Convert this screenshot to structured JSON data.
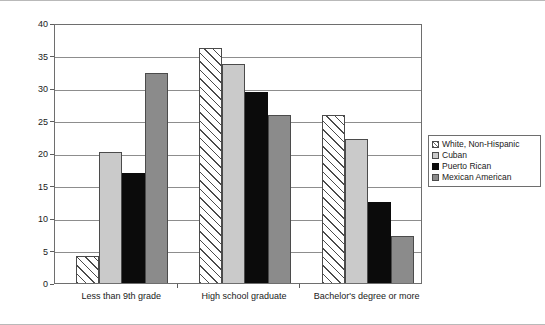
{
  "chart_data": {
    "type": "bar",
    "title": "",
    "subtitle": "",
    "xlabel": "",
    "ylabel": "Percent",
    "ylim": [
      0,
      40
    ],
    "yticks": [
      0,
      5,
      10,
      15,
      20,
      25,
      30,
      35,
      40
    ],
    "ytick_labels": [
      "0",
      "5",
      "10",
      "15",
      "20",
      "25",
      "30",
      "35",
      "40"
    ],
    "grid": true,
    "legend_position": "right",
    "categories": [
      "Less than 9th grade",
      "High school graduate",
      "Bachelor's degree or more"
    ],
    "series": [
      {
        "name": "White, Non-Hispanic",
        "fill": "diagonal-hatch",
        "color": "#ffffff",
        "values": [
          4.2,
          36.1,
          25.9
        ]
      },
      {
        "name": "Cuban",
        "fill": "solid",
        "color": "#cacaca",
        "values": [
          20.2,
          33.7,
          22.2
        ]
      },
      {
        "name": "Puerto Rican",
        "fill": "solid",
        "color": "#0b0b0b",
        "values": [
          17.0,
          29.4,
          12.4
        ]
      },
      {
        "name": "Mexican American",
        "fill": "solid",
        "color": "#8b8b8b",
        "values": [
          32.3,
          25.9,
          7.2
        ]
      }
    ]
  },
  "legend": {
    "items": [
      {
        "label": "White, Non-Hispanic"
      },
      {
        "label": "Cuban"
      },
      {
        "label": "Puerto Rican"
      },
      {
        "label": "Mexican American"
      }
    ]
  }
}
